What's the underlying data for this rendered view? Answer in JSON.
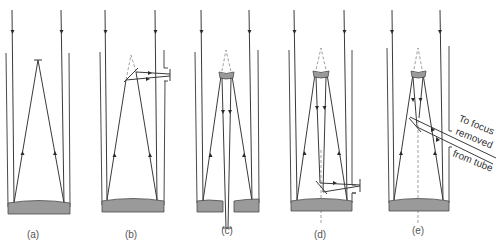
{
  "figure": {
    "panels": [
      {
        "id": "a",
        "label": "(a)"
      },
      {
        "id": "b",
        "label": "(b)"
      },
      {
        "id": "c",
        "label": "(c)"
      },
      {
        "id": "d",
        "label": "(d)"
      },
      {
        "id": "e",
        "label": "(e)"
      }
    ],
    "annotation": {
      "line1": "To focus",
      "line2": "removed",
      "line3": "from tube"
    },
    "colors": {
      "line": "#3a3a3a",
      "mirror_fill": "#9a9a9a",
      "background": "#ffffff"
    }
  }
}
